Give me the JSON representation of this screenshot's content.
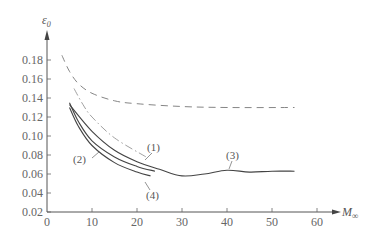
{
  "chart_data": {
    "type": "line",
    "title": "",
    "xlabel": "M∞",
    "ylabel": "ε₀",
    "xlim": [
      0,
      65
    ],
    "ylim": [
      0.02,
      0.19
    ],
    "grid": false,
    "legend": "inline labels",
    "x_ticks": [
      "0",
      "10",
      "20",
      "30",
      "40",
      "50",
      "60"
    ],
    "y_ticks": [
      "0.02",
      "0.04",
      "0.06",
      "0.08",
      "0.10",
      "0.12",
      "0.14",
      "0.16",
      "0.18"
    ],
    "series": [
      {
        "name": "dashed (unlabeled)",
        "style": "dashed",
        "x": [
          3.3,
          5,
          7,
          10,
          15,
          20,
          30,
          40,
          55
        ],
        "y": [
          0.185,
          0.168,
          0.155,
          0.145,
          0.137,
          0.134,
          0.131,
          0.13,
          0.13
        ]
      },
      {
        "name": "(1)",
        "style": "dash-dot",
        "x": [
          6,
          8,
          10,
          15,
          22
        ],
        "y": [
          0.15,
          0.133,
          0.12,
          0.098,
          0.078
        ]
      },
      {
        "name": "(2)",
        "style": "solid",
        "x": [
          5,
          7,
          10,
          15,
          20,
          24
        ],
        "y": [
          0.135,
          0.115,
          0.095,
          0.078,
          0.068,
          0.063
        ]
      },
      {
        "name": "(3)",
        "style": "solid",
        "x": [
          5,
          10,
          15,
          20,
          25,
          30,
          35,
          40,
          45,
          50,
          55
        ],
        "y": [
          0.133,
          0.105,
          0.085,
          0.073,
          0.065,
          0.058,
          0.06,
          0.064,
          0.062,
          0.063,
          0.063
        ]
      },
      {
        "name": "(4)",
        "style": "solid",
        "x": [
          5,
          7,
          10,
          15,
          20,
          23
        ],
        "y": [
          0.13,
          0.11,
          0.09,
          0.072,
          0.062,
          0.058
        ]
      }
    ],
    "annotations": [
      "(1)",
      "(2)",
      "(3)",
      "(4)"
    ]
  },
  "labels": {
    "y_axis_title": "ε",
    "y_axis_sub": "0",
    "x_axis_title": "M",
    "x_axis_sub": "∞",
    "curve1": "(1)",
    "curve2": "(2)",
    "curve3": "(3)",
    "curve4": "(4)"
  }
}
